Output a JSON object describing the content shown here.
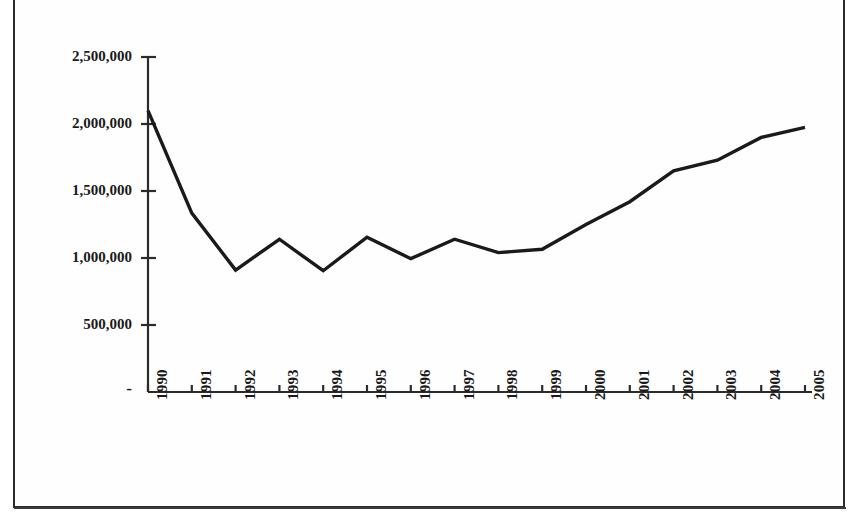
{
  "chart_data": {
    "type": "line",
    "title": "",
    "subtitle": "",
    "xlabel": "",
    "ylabel": "",
    "grid": false,
    "legend": false,
    "legend_position": "none",
    "line_color": "#1a1a1a",
    "background_color": "#ffffff",
    "axis_color": "#2b2b2b",
    "categories": [
      "1990",
      "1991",
      "1992",
      "1993",
      "1994",
      "1995",
      "1996",
      "1997",
      "1998",
      "1999",
      "2000",
      "2001",
      "2002",
      "2003",
      "2004",
      "2005"
    ],
    "values": [
      2100000,
      1335000,
      910000,
      1140000,
      905000,
      1155000,
      995000,
      1140000,
      1040000,
      1065000,
      1250000,
      1420000,
      1650000,
      1730000,
      1900000,
      1975000
    ],
    "series": [
      {
        "name": "series-1",
        "values": [
          2100000,
          1335000,
          910000,
          1140000,
          905000,
          1155000,
          995000,
          1140000,
          1040000,
          1065000,
          1250000,
          1420000,
          1650000,
          1730000,
          1900000,
          1975000
        ]
      }
    ],
    "ylim": [
      0,
      2500000
    ],
    "ytick_values": [
      0,
      500000,
      1000000,
      1500000,
      2000000,
      2500000
    ],
    "ytick_labels": [
      "-",
      "500,000",
      "1,000,000",
      "1,500,000",
      "2,000,000",
      "2,500,000"
    ],
    "xtick_labels": [
      "1990",
      "1991",
      "1992",
      "1993",
      "1994",
      "1995",
      "1996",
      "1997",
      "1998",
      "1999",
      "2000",
      "2001",
      "2002",
      "2003",
      "2004",
      "2005"
    ],
    "xtick_rotation": -90,
    "annotations": []
  }
}
